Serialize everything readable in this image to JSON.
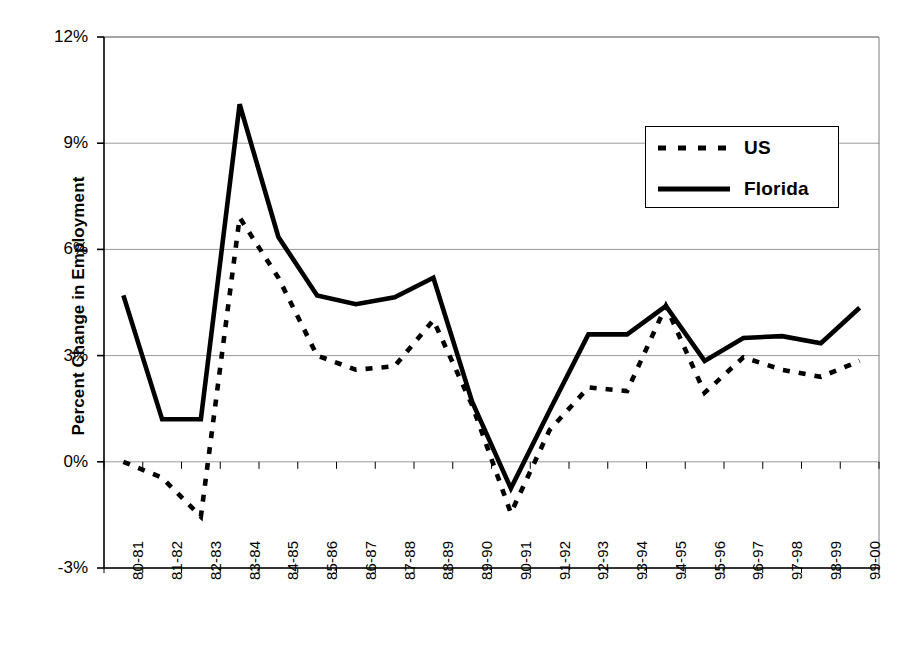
{
  "chart_data": {
    "type": "line",
    "title": "",
    "xlabel": "",
    "ylabel": "Percent Change in Employment",
    "ylim": [
      -3,
      12
    ],
    "ytick_labels": [
      "12%",
      "9%",
      "6%",
      "3%",
      "0%",
      "-3%"
    ],
    "ytick_values": [
      12,
      9,
      6,
      3,
      0,
      -3
    ],
    "grid": true,
    "legend_position": "upper-right",
    "categories": [
      "80-81",
      "81-82",
      "82-83",
      "83-84",
      "84-85",
      "85-86",
      "86-87",
      "87-88",
      "88-89",
      "89-90",
      "90-91",
      "91-92",
      "92-93",
      "93-94",
      "94-95",
      "95-96",
      "96-97",
      "97-98",
      "98-99",
      "99-00"
    ],
    "series": [
      {
        "name": "US",
        "style": "dashed",
        "color": "#000000",
        "values": [
          0.0,
          -0.45,
          -1.55,
          6.9,
          5.2,
          3.0,
          2.6,
          2.7,
          4.0,
          1.6,
          -1.45,
          0.9,
          2.1,
          2.0,
          4.4,
          1.95,
          2.95,
          2.6,
          2.4,
          2.85
        ]
      },
      {
        "name": "Florida",
        "style": "solid",
        "color": "#000000",
        "values": [
          4.7,
          1.2,
          1.2,
          10.1,
          6.35,
          4.7,
          4.45,
          4.65,
          5.2,
          1.7,
          -0.75,
          1.45,
          3.6,
          3.6,
          4.4,
          2.85,
          3.5,
          3.55,
          3.35,
          4.35
        ]
      }
    ]
  },
  "legend": {
    "entries": [
      {
        "label": "US",
        "style": "dashed"
      },
      {
        "label": "Florida",
        "style": "solid"
      }
    ]
  },
  "colors": {
    "line": "#000000",
    "axis": "#000000",
    "grid": "#9a9a9a",
    "background": "#ffffff"
  }
}
